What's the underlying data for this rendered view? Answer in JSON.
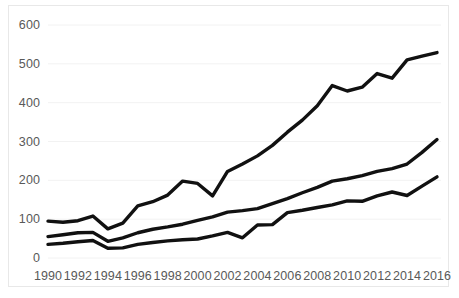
{
  "chart_data": {
    "type": "line",
    "title": "",
    "subtitle": "",
    "xlabel": "",
    "ylabel": "",
    "xlim": [
      1990,
      2016
    ],
    "ylim": [
      0,
      600
    ],
    "ytick_values": [
      0,
      100,
      200,
      300,
      400,
      500,
      600
    ],
    "ytick_labels": [
      "0",
      "100",
      "200",
      "300",
      "400",
      "500",
      "600"
    ],
    "xtick_values": [
      1990,
      1992,
      1994,
      1996,
      1998,
      2000,
      2002,
      2004,
      2006,
      2008,
      2010,
      2012,
      2014,
      2016
    ],
    "xtick_labels": [
      "1990",
      "1992",
      "1994",
      "1996",
      "1998",
      "2000",
      "2002",
      "2004",
      "2006",
      "2008",
      "2010",
      "2012",
      "2014",
      "2016"
    ],
    "grid": "horizontal",
    "grid_color": "#f2f2f2",
    "legend": "none",
    "line_color": "#111111",
    "line_width": 3.4,
    "x": [
      1990,
      1991,
      1992,
      1993,
      1994,
      1995,
      1996,
      1997,
      1998,
      1999,
      2000,
      2001,
      2002,
      2003,
      2004,
      2005,
      2006,
      2007,
      2008,
      2009,
      2010,
      2011,
      2012,
      2013,
      2014,
      2015,
      2016
    ],
    "series": [
      {
        "name": "upper-line",
        "values": [
          95,
          92,
          96,
          108,
          75,
          90,
          134,
          145,
          162,
          198,
          192,
          160,
          223,
          242,
          263,
          290,
          324,
          355,
          392,
          444,
          430,
          440,
          475,
          463,
          510,
          520,
          529
        ]
      },
      {
        "name": "middle-line",
        "values": [
          55,
          60,
          65,
          66,
          43,
          52,
          65,
          74,
          80,
          87,
          97,
          106,
          118,
          122,
          127,
          140,
          153,
          168,
          182,
          198,
          204,
          212,
          223,
          230,
          242,
          272,
          305
        ]
      },
      {
        "name": "lower-line",
        "values": [
          35,
          38,
          42,
          45,
          25,
          26,
          35,
          40,
          44,
          47,
          49,
          57,
          66,
          52,
          85,
          86,
          117,
          123,
          130,
          137,
          147,
          146,
          160,
          170,
          161,
          185,
          209
        ]
      }
    ]
  }
}
